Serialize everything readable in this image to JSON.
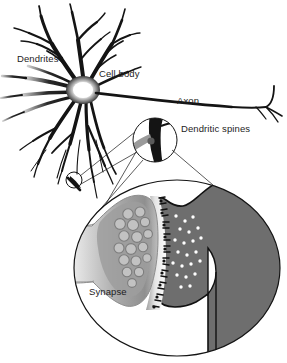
{
  "figure": {
    "background_color": "#ffffff",
    "width": 287,
    "height": 363
  },
  "labels": {
    "dendrites": "Dendrites",
    "cell_body": "Cell body",
    "axon": "Axon",
    "dendritic_spines": "Dendritic spines",
    "synapse": "Synapse"
  },
  "colors": {
    "ink": "#1d1d1d",
    "outline": "#000000",
    "postsynaptic_gray": "#6e6e6e",
    "terminal_gray": "#a0a0a0",
    "vesicle_fill": "#b9b9b9",
    "vesicle_stroke": "#7a7a7a",
    "neurotransmitter": "#ffffff",
    "soma_glow": "#ffffff",
    "spine_stub_gray": "#9a9a9a",
    "label_text": "#1d1d1d"
  },
  "structures": {
    "soma": {
      "name": "Cell body (soma)",
      "center_x": 82,
      "center_y": 90
    },
    "axon": {
      "name": "Axon",
      "start_x": 95,
      "end_x": 272,
      "terminal_branches": 2
    },
    "dendrite_marker_circle": {
      "cx": 74,
      "cy": 180,
      "r": 8
    },
    "inset_spines_circle": {
      "cx": 155,
      "cy": 140,
      "r": 22
    },
    "inset_synapse_circle": {
      "cx": 177,
      "cy": 268,
      "rx": 103,
      "ry": 88
    }
  },
  "synapse_detail": {
    "presynaptic_terminal": "axon terminal bouton",
    "vesicle_count": 17,
    "neurotransmitter_dot_count": 22,
    "receptor_marks": "dark spikes along postsynaptic membrane",
    "postsynaptic_element": "dendritic spine / dendrite shaft"
  }
}
